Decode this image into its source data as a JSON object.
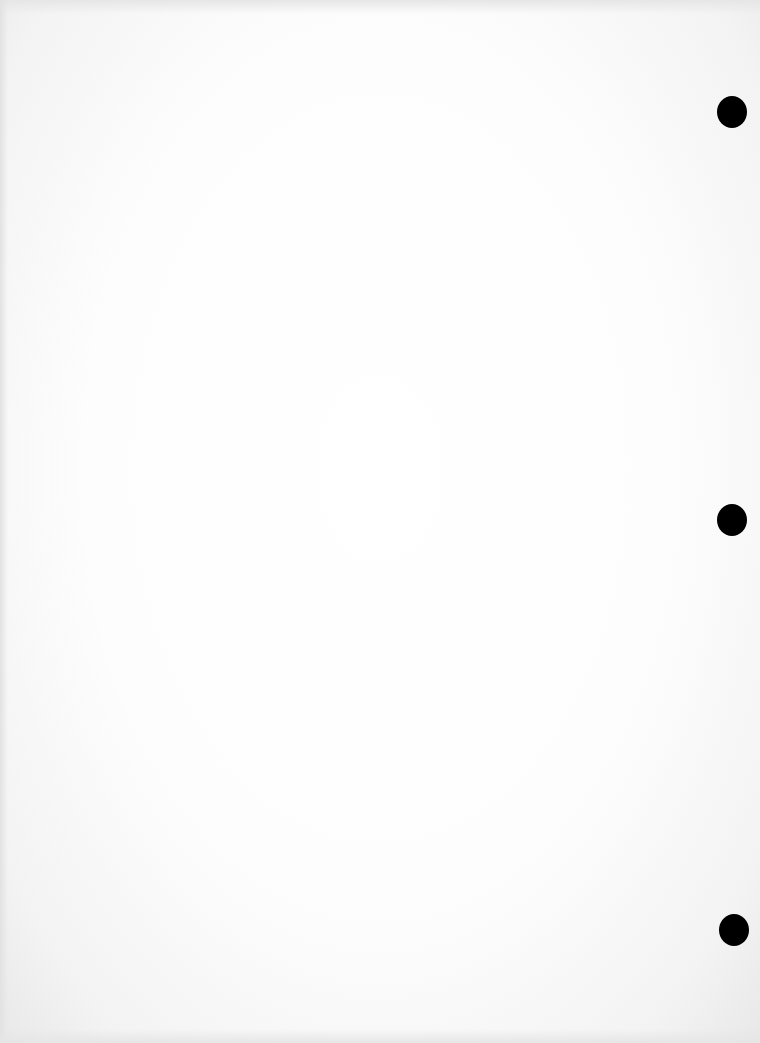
{
  "document": {
    "type": "blank scanned page",
    "background_color": "#fefefe",
    "show_through_text": "",
    "punch_holes": [
      {
        "x": 717,
        "y": 96,
        "w": 30,
        "h": 32
      },
      {
        "x": 717,
        "y": 504,
        "w": 30,
        "h": 32
      },
      {
        "x": 719,
        "y": 914,
        "w": 30,
        "h": 32
      }
    ],
    "hole_color": "#000000"
  }
}
